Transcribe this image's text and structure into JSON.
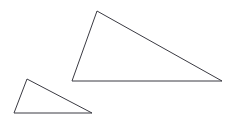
{
  "canvas": {
    "width": 230,
    "height": 123,
    "background_color": "#ffffff"
  },
  "figure": {
    "shape_count": 2
  },
  "style": {
    "stroke_color": "#3a3a42",
    "stroke_width": 1,
    "fill": "none"
  },
  "chart_data": {
    "type": "diagram",
    "xlabel": "",
    "ylabel": "",
    "grid": false,
    "legend": "none",
    "xlim": [
      0,
      230
    ],
    "ylim": [
      0,
      123
    ],
    "shapes": [
      {
        "name": "large-triangle",
        "type": "triangle",
        "points": [
          [
            97,
            11
          ],
          [
            72,
            81
          ],
          [
            222,
            81
          ]
        ],
        "points_str": "97,11 72,81 222,81",
        "stroke": "#3a3a42",
        "fill": "none"
      },
      {
        "name": "small-triangle",
        "type": "triangle",
        "points": [
          [
            27,
            79
          ],
          [
            14,
            113
          ],
          [
            92,
            113
          ]
        ],
        "points_str": "27,79 14,113 92,113",
        "stroke": "#3a3a42",
        "fill": "none"
      }
    ]
  }
}
